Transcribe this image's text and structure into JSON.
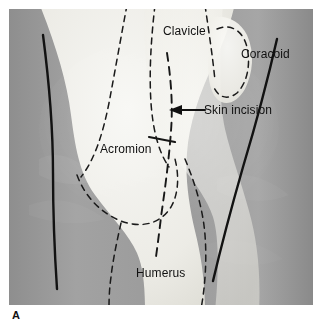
{
  "figure": {
    "caption_letter": "A",
    "background_color": "#9c9c9c",
    "ink_color": "#111111",
    "bone_color": "#f2f1ec",
    "page_background": "#ffffff"
  },
  "labels": {
    "clavicle": "Clavicle",
    "coracoid": "Coracoid",
    "skin_incision": "Skin incision",
    "acromion": "Acromion",
    "humerus": "Humerus"
  },
  "annotations": {
    "leader_arrow": "arrow-left-icon",
    "incision_line_style": "dashed",
    "bone_outline_style": "dashed"
  }
}
